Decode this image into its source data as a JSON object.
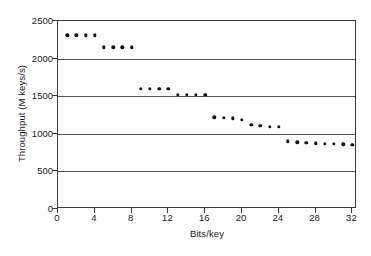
{
  "chart_data": {
    "type": "scatter",
    "title": "",
    "xlabel": "Bits/key",
    "ylabel": "Throughput (M keys/s)",
    "xlim": [
      0,
      32.5
    ],
    "ylim": [
      0,
      2500
    ],
    "xticks": [
      0,
      4,
      8,
      12,
      16,
      20,
      24,
      28,
      32
    ],
    "yticks": [
      0,
      500,
      1000,
      1500,
      2000,
      2500
    ],
    "grid": "horizontal",
    "legend": "none",
    "marker": "filled-circle",
    "marker_color": "#141414",
    "x": [
      1,
      2,
      3,
      4,
      5,
      6,
      7,
      8,
      9,
      10,
      11,
      12,
      13,
      14,
      15,
      16,
      17,
      18,
      19,
      20,
      21,
      22,
      23,
      24,
      25,
      26,
      27,
      28,
      29,
      30,
      31,
      32
    ],
    "values": [
      2310,
      2310,
      2310,
      2310,
      2150,
      2150,
      2150,
      2150,
      1600,
      1600,
      1600,
      1600,
      1520,
      1520,
      1520,
      1520,
      1220,
      1215,
      1205,
      1190,
      1120,
      1105,
      1095,
      1090,
      900,
      885,
      880,
      875,
      870,
      865,
      860,
      855
    ]
  },
  "axis": {
    "y_title": "Throughput (M keys/s)",
    "x_title": "Bits/key",
    "y_tick_labels": [
      "2500",
      "2000",
      "1500",
      "1000",
      "500",
      "0"
    ],
    "x_tick_labels": [
      "0",
      "4",
      "8",
      "12",
      "16",
      "20",
      "24",
      "28",
      "32"
    ]
  }
}
